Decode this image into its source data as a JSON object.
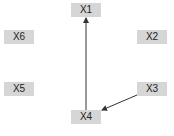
{
  "diagram": {
    "nodes": [
      {
        "id": "X1",
        "label": "X1"
      },
      {
        "id": "X2",
        "label": "X2"
      },
      {
        "id": "X3",
        "label": "X3"
      },
      {
        "id": "X4",
        "label": "X4"
      },
      {
        "id": "X5",
        "label": "X5"
      },
      {
        "id": "X6",
        "label": "X6"
      }
    ],
    "edges": [
      {
        "from": "X4",
        "to": "X1"
      },
      {
        "from": "X3",
        "to": "X4"
      }
    ],
    "colors": {
      "node_fill": "#d6d6d6",
      "edge": "#333333",
      "background": "#ffffff"
    }
  }
}
